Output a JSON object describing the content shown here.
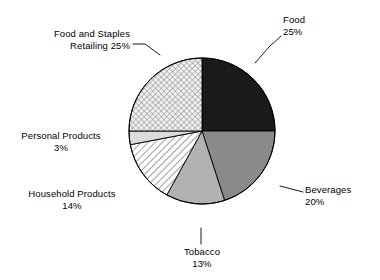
{
  "chart_data": {
    "type": "pie",
    "title": "",
    "subtitle": "",
    "xlabel": "",
    "ylabel": "",
    "legend_position": "none",
    "label_format": "name + percent",
    "start_angle_deg": 0,
    "direction": "clockwise",
    "categories": [
      "Food",
      "Beverages",
      "Tobacco",
      "Household Products",
      "Personal Products",
      "Food and Staples Retailing"
    ],
    "values": [
      25,
      20,
      13,
      14,
      3,
      25
    ],
    "units": "percent",
    "total": 100,
    "slices": [
      {
        "name": "Food",
        "value": 25,
        "percent_text": "25%",
        "label_line1": "Food",
        "label_line2": "25%",
        "fill": "#1a1a1a",
        "pattern": "solid",
        "start_deg": 0,
        "end_deg": 90
      },
      {
        "name": "Beverages",
        "value": 20,
        "percent_text": "20%",
        "label_line1": "Beverages",
        "label_line2": "20%",
        "fill": "#8a8a8a",
        "pattern": "solid",
        "start_deg": 90,
        "end_deg": 162
      },
      {
        "name": "Tobacco",
        "value": 13,
        "percent_text": "13%",
        "label_line1": "Tobacco",
        "label_line2": "13%",
        "fill": "#b2b2b2",
        "pattern": "solid",
        "start_deg": 162,
        "end_deg": 208.8
      },
      {
        "name": "Household Products",
        "value": 14,
        "percent_text": "14%",
        "label_line1": "Household Products",
        "label_line2": "14%",
        "fill": "#ffffff",
        "pattern": "diagonal-hatch",
        "start_deg": 208.8,
        "end_deg": 259.2
      },
      {
        "name": "Personal Products",
        "value": 3,
        "percent_text": "3%",
        "label_line1": "Personal Products",
        "label_line2": "3%",
        "fill": "#dcdcdc",
        "pattern": "solid",
        "start_deg": 259.2,
        "end_deg": 270
      },
      {
        "name": "Food and Staples Retailing",
        "value": 25,
        "percent_text": "25%",
        "label_line1": "Food and Staples",
        "label_line2": "Retailing 25%",
        "fill": "#e8e8e8",
        "pattern": "cross-hatch",
        "start_deg": 270,
        "end_deg": 360
      }
    ],
    "geometry": {
      "center_x": 202,
      "center_y": 131,
      "radius": 73
    },
    "colors": {
      "outline": "#000000",
      "background": "#ffffff",
      "text": "#000000",
      "leader_line": "#000000"
    }
  }
}
